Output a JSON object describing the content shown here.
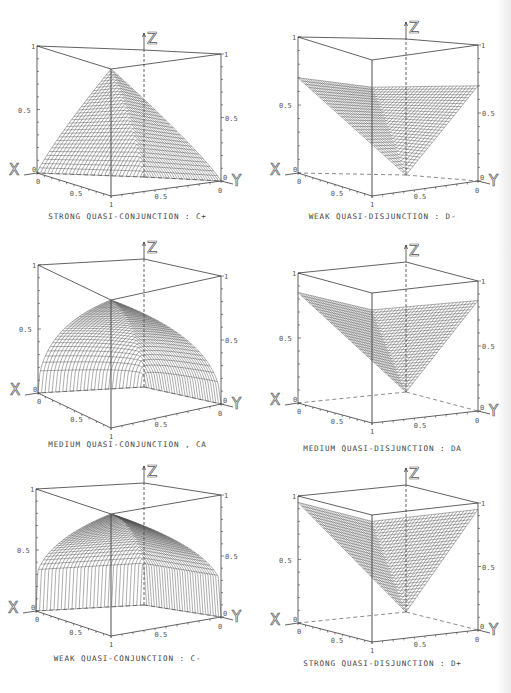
{
  "chart_data": [
    {
      "type": "surface3d",
      "title": "STRONG QUASI-CONJUNCTION : C+",
      "function": "strong_quasi_conjunction",
      "axes": {
        "x": "X",
        "y": "Y",
        "z": "Z"
      },
      "x_ticks": [
        "0",
        "0.5",
        "1"
      ],
      "y_ticks": [
        "0",
        "0.5",
        "1"
      ],
      "z_ticks": [
        "0",
        "0.5",
        "1"
      ],
      "xlim": [
        0,
        1
      ],
      "ylim": [
        0,
        1
      ],
      "zlim": [
        0,
        1
      ],
      "shape": "ridge surface peaking at z=1 at (1,1), falling to 0 at x=0 or y=0"
    },
    {
      "type": "surface3d",
      "title": "WEAK QUASI-DISJUNCTION : D-",
      "function": "weak_quasi_disjunction",
      "axes": {
        "x": "X",
        "y": "Y",
        "z": "Z"
      },
      "x_ticks": [
        "0",
        "0.5",
        "1"
      ],
      "y_ticks": [
        "0",
        "0.5",
        "1"
      ],
      "z_ticks": [
        "0",
        "0.5",
        "1"
      ],
      "xlim": [
        0,
        1
      ],
      "ylim": [
        0,
        1
      ],
      "zlim": [
        0,
        1
      ],
      "shape": "valley surface, z=0 at (0,0), ~0.7 at x=1 or y=1 edges, ~0.8 at (1,1)"
    },
    {
      "type": "surface3d",
      "title": "MEDIUM QUASI-CONJUNCTION , CA",
      "function": "medium_quasi_conjunction",
      "axes": {
        "x": "X",
        "y": "Y",
        "z": "Z"
      },
      "x_ticks": [
        "0",
        "0.5",
        "1"
      ],
      "y_ticks": [
        "0",
        "0.5",
        "1"
      ],
      "z_ticks": [
        "0",
        "0.5",
        "1"
      ],
      "xlim": [
        0,
        1
      ],
      "ylim": [
        0,
        1
      ],
      "zlim": [
        0,
        1
      ],
      "shape": "dome surface, z=1 at (1,1), 0 along x=0 and y=0"
    },
    {
      "type": "surface3d",
      "title": "MEDIUM QUASI-DISJUNCTION : DA",
      "function": "medium_quasi_disjunction",
      "axes": {
        "x": "X",
        "y": "Y",
        "z": "Z"
      },
      "x_ticks": [
        "0",
        "0.5",
        "1"
      ],
      "y_ticks": [
        "0",
        "0.5",
        "1"
      ],
      "z_ticks": [
        "0",
        "0.5",
        "1"
      ],
      "xlim": [
        0,
        1
      ],
      "ylim": [
        0,
        1
      ],
      "zlim": [
        0,
        1
      ],
      "shape": "valley surface, z=0 at (0,0), ~0.85 on x=1 or y=1 edges"
    },
    {
      "type": "surface3d",
      "title": "WEAK QUASI-CONJUNCTION : C-",
      "function": "weak_quasi_conjunction",
      "axes": {
        "x": "X",
        "y": "Y",
        "z": "Z"
      },
      "x_ticks": [
        "0",
        "0.5",
        "1"
      ],
      "y_ticks": [
        "0",
        "0.5",
        "1"
      ],
      "z_ticks": [
        "0",
        "0.5",
        "1"
      ],
      "xlim": [
        0,
        1
      ],
      "ylim": [
        0,
        1
      ],
      "zlim": [
        0,
        1
      ],
      "shape": "steep dome, z=1 at (1,1), jumps to ~0.25 near edges x=0, y=0"
    },
    {
      "type": "surface3d",
      "title": "STRONG QUASI-DISJUNCTION : D+",
      "function": "strong_quasi_disjunction",
      "axes": {
        "x": "X",
        "y": "Y",
        "z": "Z"
      },
      "x_ticks": [
        "0",
        "0.5",
        "1"
      ],
      "y_ticks": [
        "0",
        "0.5",
        "1"
      ],
      "z_ticks": [
        "0",
        "0.5",
        "1"
      ],
      "xlim": [
        0,
        1
      ],
      "ylim": [
        0,
        1
      ],
      "zlim": [
        0,
        1
      ],
      "shape": "near-planar V surface, z=0 at (0,0), ~0.95 on x=1 or y=1 edges"
    }
  ],
  "panels": [
    {
      "caption": "STRONG QUASI-CONJUNCTION : C+"
    },
    {
      "caption": "WEAK QUASI-DISJUNCTION : D-"
    },
    {
      "caption": "MEDIUM QUASI-CONJUNCTION , CA"
    },
    {
      "caption": "MEDIUM QUASI-DISJUNCTION : DA"
    },
    {
      "caption": "WEAK QUASI-CONJUNCTION : C-"
    },
    {
      "caption": "STRONG QUASI-DISJUNCTION : D+"
    }
  ],
  "labels": {
    "x_axis": "X",
    "y_axis": "Y",
    "z_axis": "Z",
    "tick_0": "0",
    "tick_half": "0.5",
    "tick_1": "1"
  },
  "colors": {
    "line": "#3a3a3a",
    "mesh": "#4a4a4a",
    "background": "#ffffff"
  }
}
